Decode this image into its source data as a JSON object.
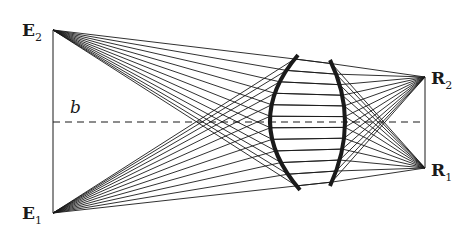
{
  "figure": {
    "type": "optical ray diagram (lens imaging two points)",
    "width": 476,
    "height": 231,
    "colors": {
      "ink": "#1a1a1a",
      "background": "#ffffff"
    }
  },
  "labels": {
    "e2": {
      "main": "E",
      "sub": "2"
    },
    "e1": {
      "main": "E",
      "sub": "1"
    },
    "r2": {
      "main": "R",
      "sub": "2"
    },
    "r1": {
      "main": "R",
      "sub": "1"
    },
    "baseline": "b"
  },
  "points": {
    "E2": [
      53,
      30
    ],
    "E1": [
      53,
      213
    ],
    "R2": [
      425,
      77
    ],
    "R1": [
      425,
      168
    ]
  },
  "baseline": {
    "y": 122,
    "x1": 53,
    "x2": 425,
    "style": "dashed"
  },
  "lens": {
    "left_surface": {
      "top": [
        298,
        55
      ],
      "mid": [
        270,
        122
      ],
      "bottom": [
        300,
        190
      ]
    },
    "right_surface": {
      "top": [
        330,
        60
      ],
      "mid": [
        345,
        122
      ],
      "bottom": [
        330,
        186
      ]
    },
    "ray_count_per_source": 12
  }
}
